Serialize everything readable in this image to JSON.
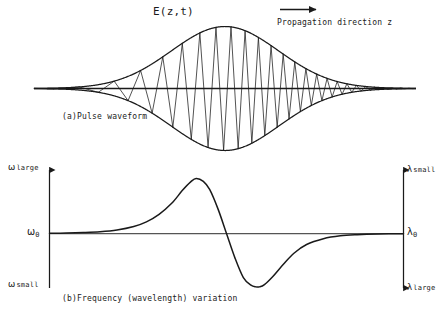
{
  "figure": {
    "title": "E(z,t)",
    "annotation_propagation": "Propagation direction z",
    "caption_a": "(a)Pulse waveform",
    "caption_b": "(b)Frequency (wavelength) variation",
    "ink_color": "#1a1a1a",
    "background_color": "#ffffff"
  },
  "axis_labels": {
    "omega_large": {
      "symbol": "ω",
      "qualifier": "large"
    },
    "omega_zero": {
      "symbol": "ω",
      "subscript": "0"
    },
    "omega_small": {
      "symbol": "ω",
      "qualifier": "small"
    },
    "lambda_small": {
      "symbol": "λ",
      "qualifier": "small"
    },
    "lambda_zero": {
      "symbol": "λ",
      "subscript": "0"
    },
    "lambda_large": {
      "symbol": "λ",
      "qualifier": "large"
    }
  },
  "chart_data": [
    {
      "type": "line",
      "name": "pulse-waveform",
      "title": "E(z,t)",
      "xlabel": "",
      "ylabel": "E(z,t)",
      "description": "Linearly chirped Gaussian pulse: carrier oscillation whose instantaneous frequency increases from left to right, modulated by a Gaussian envelope.",
      "xlim": [
        -4.2,
        4.2
      ],
      "ylim": [
        -1.05,
        1.05
      ],
      "grid": false,
      "legend": "none",
      "baseline_y": 0,
      "envelope": {
        "form": "gaussian",
        "amplitude": 1.0,
        "center": 0.0,
        "sigma": 1.18
      },
      "carrier": {
        "form": "chirped-cosine",
        "base_cycles_per_unit": 3.05,
        "chirp_rate": 0.62,
        "phase": 0.0
      },
      "envelope_profile": {
        "x": [
          -4.2,
          -3.6,
          -3.0,
          -2.4,
          -1.8,
          -1.2,
          -0.6,
          0.0,
          0.6,
          1.2,
          1.8,
          2.4,
          3.0,
          3.6,
          4.2
        ],
        "y": [
          0.002,
          0.01,
          0.04,
          0.13,
          0.32,
          0.6,
          0.88,
          1.0,
          0.88,
          0.6,
          0.32,
          0.13,
          0.04,
          0.01,
          0.002
        ]
      }
    },
    {
      "type": "line",
      "name": "frequency-variation",
      "title": "(b)Frequency (wavelength) variation",
      "xlabel": "",
      "ylabel": "ω",
      "y2label": "λ",
      "description": "Instantaneous frequency deviation across the pulse: rises to a maximum before the pulse center, crosses ω₀ at the center, then falls to a minimum. Wavelength axis on the right is inverted.",
      "xlim": [
        -4.2,
        4.2
      ],
      "ylim": [
        -1.15,
        1.15
      ],
      "grid": false,
      "legend": "none",
      "zero_level_left": "ω₀",
      "zero_level_right": "λ₀",
      "y_axis_ticks_left": [
        "ω large",
        "ω₀",
        "ω small"
      ],
      "y_axis_ticks_right": [
        "λ small",
        "λ₀",
        "λ large"
      ],
      "zero_crossing_x": 0.0,
      "peak": {
        "x": -0.72,
        "y": 0.95
      },
      "trough": {
        "x": 0.78,
        "y": -0.92
      },
      "x": [
        -4.2,
        -3.8,
        -3.4,
        -3.0,
        -2.6,
        -2.2,
        -1.9,
        -1.6,
        -1.3,
        -1.05,
        -0.85,
        -0.72,
        -0.55,
        -0.4,
        -0.2,
        0.0,
        0.2,
        0.4,
        0.58,
        0.7,
        0.78,
        0.9,
        1.1,
        1.35,
        1.6,
        1.9,
        2.3,
        2.7,
        3.1,
        3.6,
        4.2
      ],
      "y": [
        0.004,
        0.008,
        0.016,
        0.03,
        0.06,
        0.12,
        0.2,
        0.33,
        0.52,
        0.74,
        0.89,
        0.95,
        0.9,
        0.76,
        0.42,
        0.0,
        -0.42,
        -0.76,
        -0.89,
        -0.92,
        -0.92,
        -0.88,
        -0.74,
        -0.53,
        -0.34,
        -0.19,
        -0.09,
        -0.04,
        -0.02,
        -0.008,
        -0.003
      ]
    }
  ]
}
